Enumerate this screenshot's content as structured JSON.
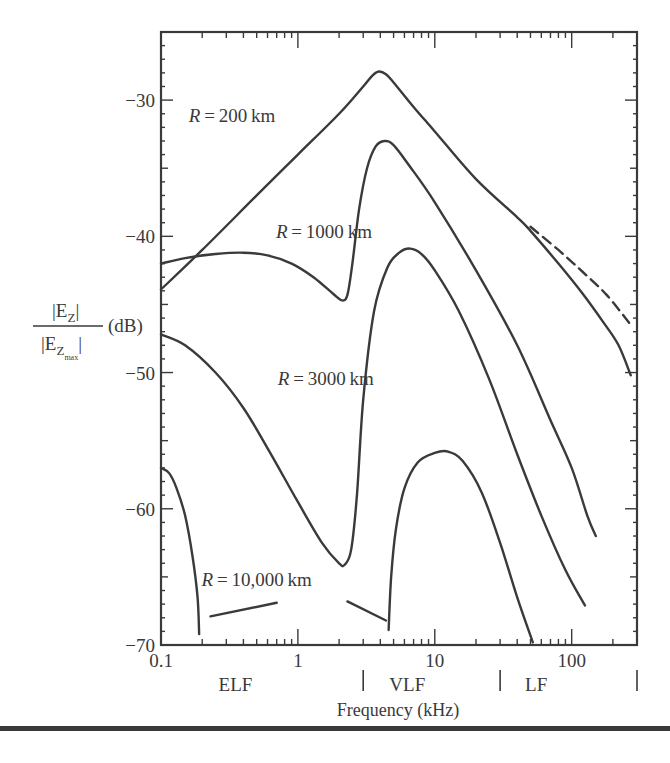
{
  "chart_data": {
    "type": "line",
    "title": "",
    "xlabel": "Frequency (kHz)",
    "ylabel": "|E_Z| / |E_Z_max| (dB)",
    "ylabel_parts": {
      "numerator": "|E",
      "numerator_sub": "Z",
      "numerator_end": "|",
      "denominator": "|E",
      "denominator_sub": "Z",
      "denominator_subsub": "max",
      "denominator_end": "|",
      "unit": "(dB)"
    },
    "x_scale": "log",
    "xlim": [
      0.1,
      300
    ],
    "ylim": [
      -70,
      -25
    ],
    "x_ticks": [
      0.1,
      1,
      10,
      100
    ],
    "x_tick_labels": [
      "0.1",
      "1",
      "10",
      "100"
    ],
    "y_ticks": [
      -30,
      -40,
      -50,
      -60,
      -70
    ],
    "y_tick_labels": [
      "−30",
      "−40",
      "−50",
      "−60",
      "−70"
    ],
    "grid": false,
    "bands": [
      {
        "label": "ELF",
        "from": 0.1,
        "to": 3
      },
      {
        "label": "VLF",
        "from": 3,
        "to": 30
      },
      {
        "label": "LF",
        "from": 30,
        "to": 300
      }
    ],
    "band_dividers": [
      3,
      30,
      300
    ],
    "series": [
      {
        "name": "R = 200 km",
        "label": "R = 200 km",
        "label_pos": [
          0.33,
          -31.6
        ],
        "style": "solid",
        "points": [
          [
            0.1,
            -43.9
          ],
          [
            0.2,
            -41.0
          ],
          [
            0.5,
            -37.0
          ],
          [
            1.0,
            -34.0
          ],
          [
            2.0,
            -31.0
          ],
          [
            3.0,
            -29.0
          ],
          [
            3.5,
            -28.2
          ],
          [
            3.9,
            -27.9
          ],
          [
            4.4,
            -28.1
          ],
          [
            5.0,
            -28.7
          ],
          [
            7.0,
            -30.5
          ],
          [
            10,
            -32.3
          ],
          [
            20,
            -35.8
          ],
          [
            40,
            -38.6
          ],
          [
            50,
            -39.6
          ],
          [
            80,
            -42.0
          ],
          [
            120,
            -44.2
          ],
          [
            170,
            -46.3
          ],
          [
            220,
            -48.0
          ],
          [
            270,
            -50.2
          ]
        ]
      },
      {
        "name": "R = 200 km (dashed extension)",
        "label": "",
        "style": "dashed",
        "points": [
          [
            50,
            -39.3
          ],
          [
            80,
            -41.0
          ],
          [
            120,
            -42.6
          ],
          [
            180,
            -44.3
          ],
          [
            270,
            -46.5
          ]
        ]
      },
      {
        "name": "R = 1000 km",
        "label": "R = 1000 km",
        "label_pos": [
          1.55,
          -40.1
        ],
        "style": "solid",
        "points": [
          [
            0.1,
            -42.0
          ],
          [
            0.15,
            -41.6
          ],
          [
            0.25,
            -41.3
          ],
          [
            0.4,
            -41.2
          ],
          [
            0.6,
            -41.4
          ],
          [
            0.9,
            -42.0
          ],
          [
            1.3,
            -43.0
          ],
          [
            1.8,
            -44.2
          ],
          [
            2.1,
            -44.7
          ],
          [
            2.3,
            -44.3
          ],
          [
            2.5,
            -42.0
          ],
          [
            2.8,
            -38.0
          ],
          [
            3.2,
            -35.0
          ],
          [
            3.7,
            -33.4
          ],
          [
            4.3,
            -33.0
          ],
          [
            5.0,
            -33.3
          ],
          [
            6.5,
            -34.8
          ],
          [
            10,
            -37.5
          ],
          [
            20,
            -42.5
          ],
          [
            40,
            -48.0
          ],
          [
            70,
            -53.5
          ],
          [
            100,
            -57.0
          ],
          [
            130,
            -60.5
          ],
          [
            150,
            -62.0
          ]
        ]
      },
      {
        "name": "R = 3000 km",
        "label": "R = 3000 km",
        "label_pos": [
          1.6,
          -50.9
        ],
        "style": "solid",
        "points": [
          [
            0.1,
            -47.2
          ],
          [
            0.15,
            -48.0
          ],
          [
            0.25,
            -50.0
          ],
          [
            0.4,
            -52.6
          ],
          [
            0.62,
            -55.8
          ],
          [
            1.0,
            -59.5
          ],
          [
            1.5,
            -62.5
          ],
          [
            2.0,
            -64.0
          ],
          [
            2.2,
            -64.1
          ],
          [
            2.45,
            -63.0
          ],
          [
            2.7,
            -59.0
          ],
          [
            3.0,
            -52.0
          ],
          [
            3.6,
            -45.5
          ],
          [
            4.5,
            -42.3
          ],
          [
            5.5,
            -41.2
          ],
          [
            6.6,
            -40.9
          ],
          [
            8,
            -41.3
          ],
          [
            10,
            -42.5
          ],
          [
            15,
            -45.5
          ],
          [
            25,
            -50.5
          ],
          [
            40,
            -56.0
          ],
          [
            60,
            -60.5
          ],
          [
            90,
            -64.5
          ],
          [
            125,
            -67.1
          ]
        ]
      },
      {
        "name": "R = 10,000 km",
        "label": "R = 10,000 km",
        "label_pos": [
          0.5,
          -65.7
        ],
        "style": "solid",
        "points": [
          [
            0.1,
            -57.0
          ],
          [
            0.115,
            -57.4
          ],
          [
            0.13,
            -58.5
          ],
          [
            0.15,
            -60.5
          ],
          [
            0.17,
            -63.5
          ],
          [
            0.185,
            -66.5
          ],
          [
            0.19,
            -69.2
          ]
        ]
      },
      {
        "name": "R = 10,000 km (dashed segment 1)",
        "label": "",
        "style": "solid",
        "points": [
          [
            0.23,
            -67.9
          ],
          [
            0.7,
            -66.9
          ]
        ]
      },
      {
        "name": "R = 10,000 km (dashed segment 2)",
        "label": "",
        "style": "solid",
        "points": [
          [
            2.3,
            -66.8
          ],
          [
            4.4,
            -68.2
          ]
        ]
      },
      {
        "name": "R = 10,000 km (VLF lobe)",
        "label": "",
        "style": "solid",
        "points": [
          [
            4.6,
            -68.9
          ],
          [
            4.8,
            -65.0
          ],
          [
            5.2,
            -61.5
          ],
          [
            6.0,
            -58.5
          ],
          [
            7.5,
            -56.6
          ],
          [
            10,
            -55.9
          ],
          [
            12.5,
            -55.8
          ],
          [
            16,
            -56.5
          ],
          [
            22,
            -58.8
          ],
          [
            30,
            -62.5
          ],
          [
            40,
            -66.5
          ],
          [
            52,
            -69.8
          ]
        ]
      }
    ]
  },
  "axes": {
    "xlabel": "Frequency (kHz)",
    "bands": [
      "ELF",
      "VLF",
      "LF"
    ]
  }
}
